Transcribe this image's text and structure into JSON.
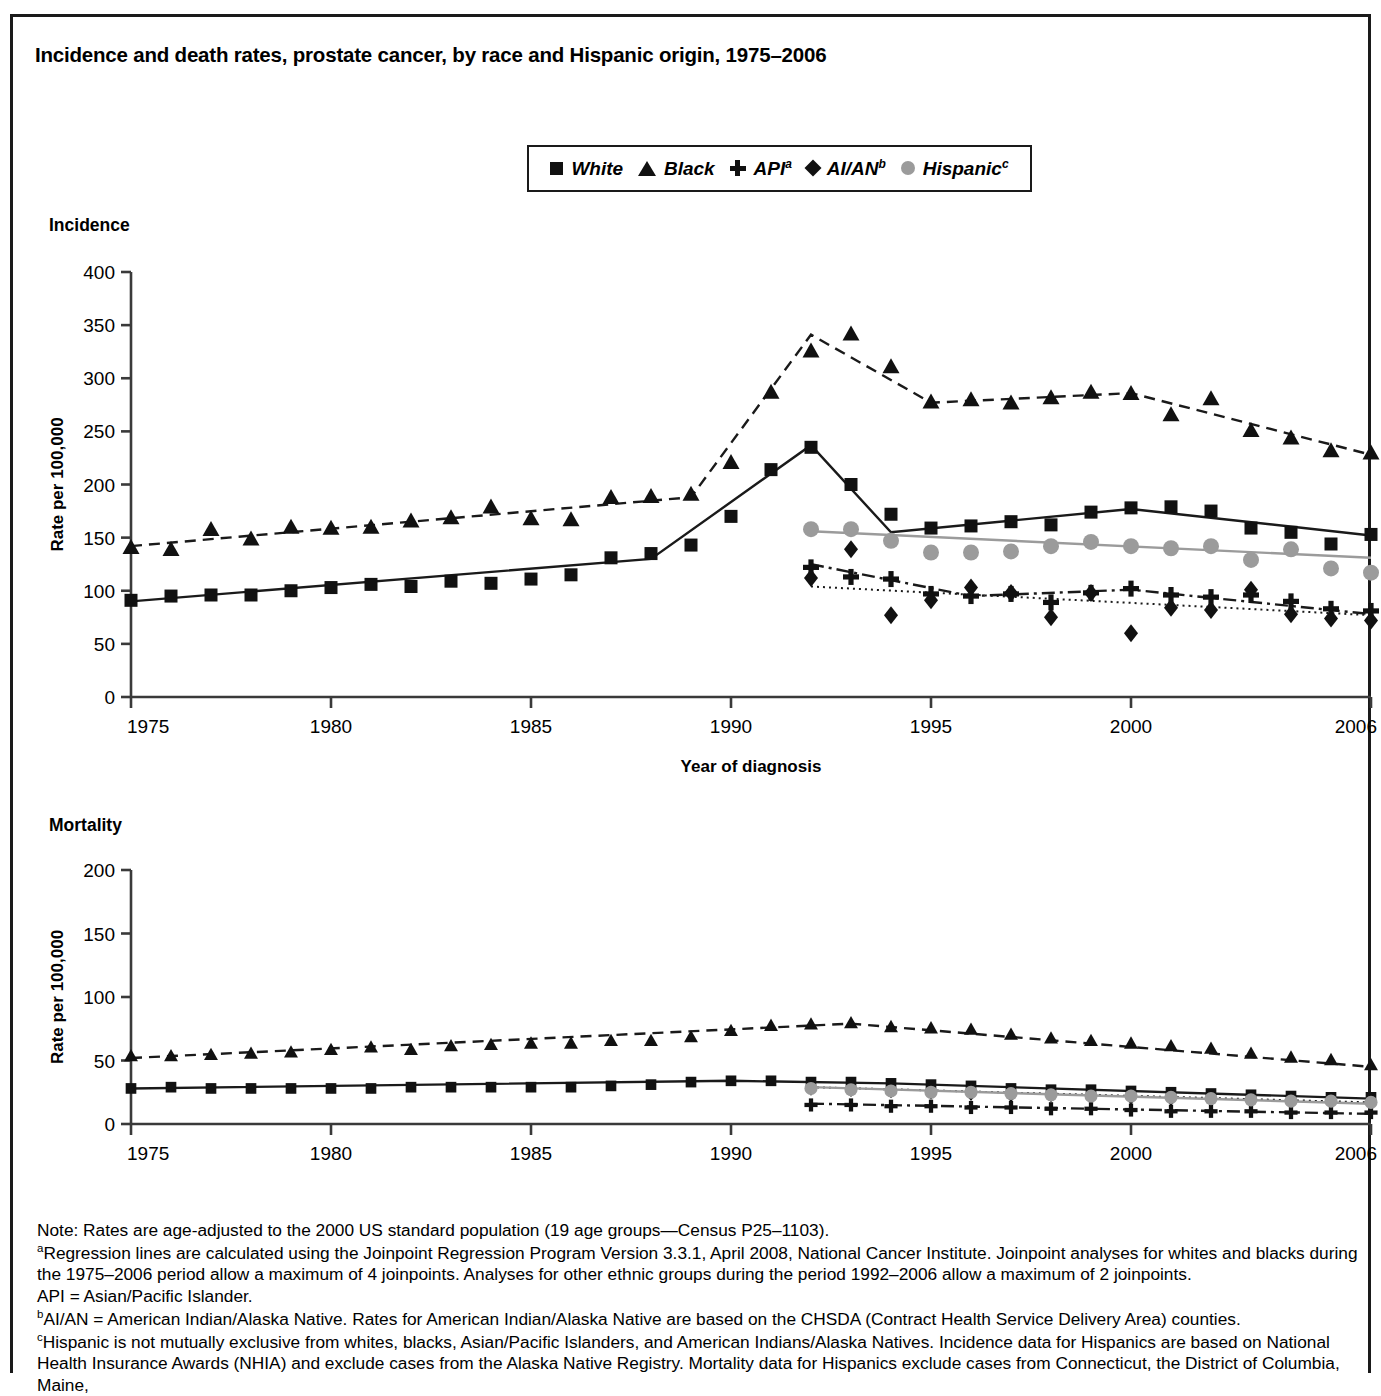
{
  "figure": {
    "title": "Incidence and death rates, prostate cancer, by race and Hispanic origin, 1975–2006",
    "incidence_caption": "Incidence",
    "mortality_caption": "Mortality",
    "y_axis_title": "Rate per 100,000",
    "incidence_x_title": "Year of diagnosis",
    "mortality_x_title": "Year of death"
  },
  "legend": {
    "items": [
      {
        "label": "White",
        "sup": "",
        "marker": "square",
        "color": "#111111"
      },
      {
        "label": "Black",
        "sup": "",
        "marker": "triangle",
        "color": "#111111"
      },
      {
        "label": "API",
        "sup": "a",
        "marker": "plus",
        "color": "#111111"
      },
      {
        "label": "AI/AN",
        "sup": "b",
        "marker": "diamond",
        "color": "#111111"
      },
      {
        "label": "Hispanic",
        "sup": "c",
        "marker": "circle",
        "color": "#9b9b9b"
      }
    ]
  },
  "footnotes": {
    "note": "Note: Rates are age-adjusted to the 2000 US standard population (19 age groups—Census P25–1103).",
    "a_line": "Regression lines are calculated using the Joinpoint Regression Program Version 3.3.1, April 2008, National Cancer Institute. Joinpoint analyses for whites and blacks during the 1975–2006 period allow a maximum of 4 joinpoints. Analyses for other ethnic groups during the period 1992–2006 allow a maximum of 2 joinpoints.",
    "api_line": "API = Asian/Pacific Islander.",
    "b_line": "AI/AN = American Indian/Alaska Native. Rates for American Indian/Alaska Native are based on the CHSDA (Contract Health Service Delivery Area) counties.",
    "c_line": "Hispanic is not mutually exclusive from whites, blacks, Asian/Pacific Islanders, and American Indians/Alaska Natives. Incidence data for Hispanics are based on National Health Insurance Awards (NHIA) and exclude cases from the Alaska Native Registry. Mortality data for Hispanics exclude cases from Connecticut, the District of Columbia, Maine,",
    "sup_a": "a",
    "sup_b": "b",
    "sup_c": "c"
  },
  "chart_data": [
    {
      "id": "incidence",
      "type": "scatter",
      "title": "Incidence",
      "xlabel": "Year of diagnosis",
      "ylabel": "Rate per 100,000",
      "xlim": [
        1975,
        2006
      ],
      "ylim": [
        0,
        400
      ],
      "yticks": [
        0,
        50,
        100,
        150,
        200,
        250,
        300,
        350,
        400
      ],
      "xticks": [
        1975,
        1980,
        1985,
        1990,
        1995,
        2000,
        2006
      ],
      "grid": false,
      "legend_position": "top-center",
      "series": [
        {
          "name": "White",
          "marker": "square",
          "color": "#111111",
          "line": "solid",
          "x": [
            1975,
            1976,
            1977,
            1978,
            1979,
            1980,
            1981,
            1982,
            1983,
            1984,
            1985,
            1986,
            1987,
            1988,
            1989,
            1990,
            1991,
            1992,
            1993,
            1994,
            1995,
            1996,
            1997,
            1998,
            1999,
            2000,
            2001,
            2002,
            2003,
            2004,
            2005,
            2006
          ],
          "values": [
            91,
            95,
            96,
            96,
            100,
            103,
            106,
            104,
            109,
            107,
            111,
            115,
            131,
            135,
            143,
            170,
            214,
            235,
            200,
            172,
            159,
            161,
            165,
            162,
            174,
            178,
            179,
            175,
            159,
            155,
            144,
            153
          ],
          "trend": [
            [
              1975,
              90
            ],
            [
              1988,
              130
            ],
            [
              1992,
              237
            ],
            [
              1994,
              155
            ],
            [
              2000,
              177
            ],
            [
              2006,
              152
            ]
          ]
        },
        {
          "name": "Black",
          "marker": "triangle",
          "color": "#111111",
          "line": "dashed",
          "x": [
            1975,
            1976,
            1977,
            1978,
            1979,
            1980,
            1981,
            1982,
            1983,
            1984,
            1985,
            1986,
            1987,
            1988,
            1989,
            1990,
            1991,
            1992,
            1993,
            1994,
            1995,
            1996,
            1997,
            1998,
            1999,
            2000,
            2001,
            2002,
            2003,
            2004,
            2005,
            2006
          ],
          "values": [
            140,
            138,
            157,
            148,
            159,
            158,
            159,
            165,
            168,
            178,
            167,
            166,
            187,
            188,
            190,
            220,
            286,
            325,
            341,
            310,
            277,
            279,
            276,
            281,
            286,
            285,
            265,
            280,
            250,
            243,
            231,
            229
          ],
          "trend": [
            [
              1975,
              142
            ],
            [
              1989,
              188
            ],
            [
              1992,
              341
            ],
            [
              1995,
              277
            ],
            [
              2000,
              286
            ],
            [
              2006,
              228
            ]
          ]
        },
        {
          "name": "API",
          "marker": "plus",
          "color": "#111111",
          "line": "dashdot",
          "x": [
            1992,
            1993,
            1994,
            1995,
            1996,
            1997,
            1998,
            1999,
            2000,
            2001,
            2002,
            2003,
            2004,
            2005,
            2006
          ],
          "values": [
            122,
            113,
            111,
            97,
            95,
            97,
            89,
            98,
            102,
            96,
            94,
            96,
            90,
            83,
            81
          ],
          "trend": [
            [
              1992,
              125
            ],
            [
              1996,
              95
            ],
            [
              2000,
              101
            ],
            [
              2006,
              78
            ]
          ]
        },
        {
          "name": "AI/AN",
          "marker": "diamond",
          "color": "#111111",
          "line": "dotted",
          "x": [
            1992,
            1993,
            1994,
            1995,
            1996,
            1997,
            1998,
            1999,
            2000,
            2001,
            2002,
            2003,
            2004,
            2005,
            2006
          ],
          "values": [
            112,
            139,
            77,
            91,
            103,
            98,
            75,
            98,
            60,
            84,
            82,
            101,
            78,
            74,
            72
          ],
          "trend": [
            [
              1992,
              104
            ],
            [
              2006,
              77
            ]
          ]
        },
        {
          "name": "Hispanic",
          "marker": "circle",
          "color": "#9b9b9b",
          "line": "solid-gray",
          "x": [
            1992,
            1993,
            1994,
            1995,
            1996,
            1997,
            1998,
            1999,
            2000,
            2001,
            2002,
            2003,
            2004,
            2005,
            2006
          ],
          "values": [
            158,
            158,
            147,
            136,
            136,
            137,
            142,
            146,
            142,
            140,
            142,
            129,
            139,
            121,
            117
          ],
          "trend": [
            [
              1992,
              156
            ],
            [
              2006,
              131
            ]
          ]
        }
      ]
    },
    {
      "id": "mortality",
      "type": "scatter",
      "title": "Mortality",
      "xlabel": "Year of death",
      "ylabel": "Rate per 100,000",
      "xlim": [
        1975,
        2006
      ],
      "ylim": [
        0,
        200
      ],
      "yticks": [
        0,
        50,
        100,
        150,
        200
      ],
      "xticks": [
        1975,
        1980,
        1985,
        1990,
        1995,
        2000,
        2006
      ],
      "grid": false,
      "legend_position": "top-center",
      "series": [
        {
          "name": "White",
          "marker": "square",
          "color": "#111111",
          "line": "solid",
          "x": [
            1975,
            1976,
            1977,
            1978,
            1979,
            1980,
            1981,
            1982,
            1983,
            1984,
            1985,
            1986,
            1987,
            1988,
            1989,
            1990,
            1991,
            1992,
            1993,
            1994,
            1995,
            1996,
            1997,
            1998,
            1999,
            2000,
            2001,
            2002,
            2003,
            2004,
            2005,
            2006
          ],
          "values": [
            28,
            29,
            28,
            28,
            28,
            28,
            28,
            29,
            29,
            29,
            29,
            29,
            30,
            31,
            33,
            34,
            34,
            33,
            33,
            32,
            31,
            30,
            28,
            27,
            27,
            26,
            25,
            24,
            23,
            22,
            21,
            21
          ],
          "trend": [
            [
              1975,
              28
            ],
            [
              1990,
              34
            ],
            [
              1994,
              32
            ],
            [
              2006,
              20
            ]
          ]
        },
        {
          "name": "Black",
          "marker": "triangle",
          "color": "#111111",
          "line": "dashed",
          "x": [
            1975,
            1976,
            1977,
            1978,
            1979,
            1980,
            1981,
            1982,
            1983,
            1984,
            1985,
            1986,
            1987,
            1988,
            1989,
            1990,
            1991,
            1992,
            1993,
            1994,
            1995,
            1996,
            1997,
            1998,
            1999,
            2000,
            2001,
            2002,
            2003,
            2004,
            2005,
            2006
          ],
          "values": [
            53,
            53,
            54,
            55,
            56,
            58,
            60,
            58,
            61,
            62,
            63,
            63,
            65,
            65,
            68,
            73,
            77,
            78,
            79,
            76,
            75,
            74,
            70,
            67,
            65,
            63,
            61,
            59,
            55,
            52,
            50,
            46
          ],
          "trend": [
            [
              1975,
              52
            ],
            [
              1993,
              79
            ],
            [
              2006,
              45
            ]
          ]
        },
        {
          "name": "API",
          "marker": "plus",
          "color": "#111111",
          "line": "dashdot",
          "x": [
            1992,
            1993,
            1994,
            1995,
            1996,
            1997,
            1998,
            1999,
            2000,
            2001,
            2002,
            2003,
            2004,
            2005,
            2006
          ],
          "values": [
            15,
            15,
            14,
            14,
            13,
            13,
            12,
            12,
            11,
            10,
            10,
            10,
            9,
            9,
            9
          ],
          "trend": [
            [
              1992,
              16
            ],
            [
              2006,
              8
            ]
          ]
        },
        {
          "name": "AI/AN",
          "marker": "diamond",
          "color": "#111111",
          "line": "dotted",
          "x": [
            1992,
            1993,
            1994,
            1995,
            1996,
            1997,
            1998,
            1999,
            2000,
            2001,
            2002,
            2003,
            2004,
            2005,
            2006
          ],
          "values": [
            28,
            27,
            26,
            25,
            24,
            23,
            23,
            22,
            21,
            20,
            20,
            19,
            19,
            18,
            18
          ],
          "trend": [
            [
              1992,
              29
            ],
            [
              2006,
              17
            ]
          ]
        },
        {
          "name": "Hispanic",
          "marker": "circle",
          "color": "#9b9b9b",
          "line": "solid-gray",
          "x": [
            1992,
            1993,
            1994,
            1995,
            1996,
            1997,
            1998,
            1999,
            2000,
            2001,
            2002,
            2003,
            2004,
            2005,
            2006
          ],
          "values": [
            28,
            27,
            26,
            25,
            25,
            24,
            23,
            22,
            22,
            21,
            20,
            19,
            18,
            18,
            17
          ],
          "trend": [
            [
              1992,
              29
            ],
            [
              2006,
              16
            ]
          ]
        }
      ]
    }
  ]
}
